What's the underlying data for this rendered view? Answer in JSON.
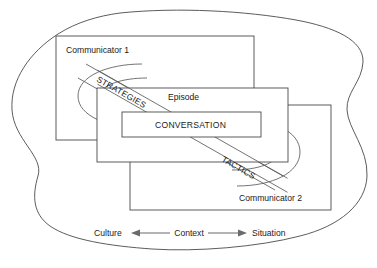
{
  "diagram": {
    "outer_boundary_name": "culture-blob",
    "boxes": [
      {
        "id": "communicator1",
        "label": "Communicator 1"
      },
      {
        "id": "episode",
        "label": "Episode"
      },
      {
        "id": "conversation",
        "label": "CONVERSATION"
      },
      {
        "id": "communicator2",
        "label": "Communicator 2"
      }
    ],
    "diagonal_bands": [
      {
        "id": "strategies",
        "label": "STRATEGIES"
      },
      {
        "id": "tactics",
        "label": "TACTICS"
      }
    ],
    "axis": {
      "left_label": "Culture",
      "center_label": "Context",
      "right_label": "Situation",
      "left_arrow": "arrow-left",
      "right_arrow": "arrow-right"
    },
    "colors": {
      "stroke": "#4a4a4a",
      "arrow": "#6b6b6b",
      "text": "#1a1a1a",
      "background": "#ffffff"
    }
  }
}
